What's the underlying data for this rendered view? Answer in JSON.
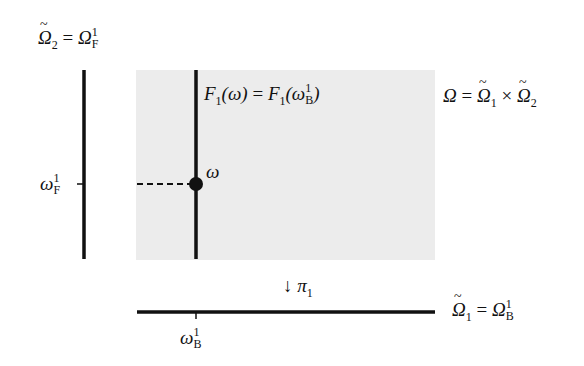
{
  "diagram": {
    "type": "product-space-projection",
    "colors": {
      "background": "#ffffff",
      "product_region_fill": "#ececec",
      "line": "#111111"
    },
    "labels": {
      "omega2_tilde": {
        "base": "Ω",
        "tilde": true,
        "sub": "2",
        "eq": "=",
        "rhs_base": "Ω",
        "rhs_sup": "1",
        "rhs_sub": "F"
      },
      "fiber_equation": {
        "lhs": "F",
        "lhs_sub": "1",
        "lhs_arg": "(ω)",
        "eq": "=",
        "rhs": "F",
        "rhs_sub": "1",
        "rhs_arg_open": "(ω",
        "rhs_arg_sup": "1",
        "rhs_arg_sub": "B",
        "rhs_arg_close": ")"
      },
      "product_space": {
        "lhs": "Ω",
        "eq": "=",
        "f1": "Ω",
        "f1_sub": "1",
        "times": "×",
        "f2": "Ω",
        "f2_sub": "2"
      },
      "point": "ω",
      "omega_f": {
        "base": "ω",
        "sup": "1",
        "sub": "F"
      },
      "projection": {
        "arrow": "↓",
        "base": "π",
        "sub": "1"
      },
      "omega1_tilde": {
        "base": "Ω",
        "sub": "1",
        "eq": "=",
        "rhs_base": "Ω",
        "rhs_sup": "1",
        "rhs_sub": "B"
      },
      "omega_b": {
        "base": "ω",
        "sup": "1",
        "sub": "B"
      }
    }
  }
}
